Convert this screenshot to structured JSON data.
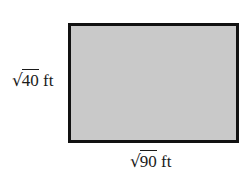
{
  "diagram": {
    "shape": "rectangle",
    "fill_color": "#c9c9c9",
    "border_color": "#111111",
    "height_label": {
      "radical": "√",
      "radicand": "40",
      "unit": "ft"
    },
    "width_label": {
      "radical": "√",
      "radicand": "90",
      "unit": "ft"
    }
  }
}
